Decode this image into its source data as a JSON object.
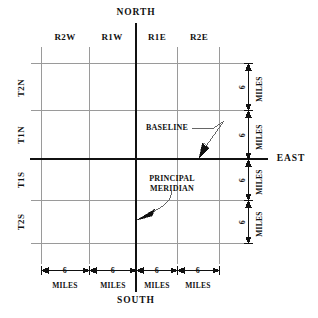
{
  "diagram": {
    "background_color": "#ffffff",
    "axis_color": "#111111",
    "grid_color": "#9a9a9a",
    "text_color": "#111111"
  },
  "cardinals": {
    "north": "NORTH",
    "south": "SOUTH",
    "east": "EAST"
  },
  "range_labels": [
    {
      "text": "R2W"
    },
    {
      "text": "R1W"
    },
    {
      "text": "R1E"
    },
    {
      "text": "R2E"
    }
  ],
  "township_labels": [
    {
      "text": "T2N"
    },
    {
      "text": "T1N"
    },
    {
      "text": "T1S"
    },
    {
      "text": "T2S"
    }
  ],
  "annotations": {
    "baseline": "BASELINE",
    "principal_meridian_line1": "PRINCIPAL",
    "principal_meridian_line2": "MERIDIAN"
  },
  "dimensions": {
    "value": "6",
    "unit": "MILES",
    "bottom": [
      {
        "value": "6",
        "unit": "MILES"
      },
      {
        "value": "6",
        "unit": "MILES"
      },
      {
        "value": "6",
        "unit": "MILES"
      },
      {
        "value": "6",
        "unit": "MILES"
      }
    ],
    "right": [
      {
        "value": "6",
        "unit": "MILES"
      },
      {
        "value": "6",
        "unit": "MILES"
      },
      {
        "value": "6",
        "unit": "MILES"
      },
      {
        "value": "6",
        "unit": "MILES"
      }
    ]
  }
}
